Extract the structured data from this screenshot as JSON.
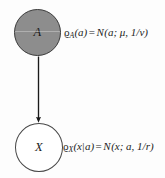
{
  "diagram": {
    "background_color": "#fdfdfd",
    "nodes": [
      {
        "id": "A",
        "label": "A",
        "shape": "circle",
        "fill_color": "#8d8d8d",
        "stroke_color": "#3a3a3a",
        "observed": true,
        "role": "latent-parent"
      },
      {
        "id": "X",
        "label": "X",
        "shape": "circle",
        "fill_color": "#ffffff",
        "stroke_color": "#474747",
        "observed": false,
        "role": "observed-child"
      }
    ],
    "edges": [
      {
        "from": "A",
        "to": "X",
        "direction": "down",
        "arrowhead": "filled-triangle",
        "color": "#1a1a1a"
      }
    ],
    "formulas": {
      "node_a": {
        "density": "ϱ",
        "subscript": "A",
        "argument": "(a)",
        "equals": "=",
        "distribution": "N",
        "params": "(a; μ, 1/v)",
        "full_text": "ϱₐ(a) = N(a; μ, 1/v)"
      },
      "node_x": {
        "density": "ϱ",
        "subscript": "X",
        "argument_left": "(x",
        "conditional_bar": "|",
        "argument_right": "a)",
        "equals": "=",
        "distribution": "N",
        "params": "(x; a, 1/r)",
        "full_text": "ϱₓ(x|a) = N(x; a, 1/r)"
      }
    }
  }
}
